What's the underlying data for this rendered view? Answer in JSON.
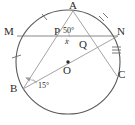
{
  "figure": {
    "type": "circle-geometry-diagram",
    "stroke_color": "#4a4a4a",
    "thin_stroke_color": "#9a9a9a",
    "text_color": "#2b2b2b",
    "background": "#ffffff",
    "circle": {
      "cx": 68,
      "cy": 62,
      "r": 52
    }
  },
  "points": {
    "A": {
      "label": "A",
      "x": 73,
      "y": 11,
      "lx": 69,
      "ly": 1
    },
    "M": {
      "label": "M",
      "x": 17,
      "y": 36,
      "lx": 6,
      "ly": 27
    },
    "N": {
      "label": "N",
      "x": 118,
      "y": 36,
      "lx": 118,
      "ly": 27
    },
    "B": {
      "label": "B",
      "x": 23,
      "y": 89,
      "lx": 12,
      "ly": 84
    },
    "C": {
      "label": "C",
      "x": 117,
      "y": 76,
      "lx": 119,
      "ly": 70
    },
    "P": {
      "label": "P",
      "x": 61,
      "y": 36,
      "lx": 55,
      "ly": 27
    },
    "Q": {
      "label": "Q",
      "x": 82,
      "y": 43,
      "lx": 79,
      "ly": 40
    },
    "O": {
      "label": "O",
      "x": 68,
      "y": 62,
      "lx": 64,
      "ly": 66
    }
  },
  "angles": {
    "at_P": {
      "value": "50",
      "unit": "°",
      "text": "50°",
      "lx": 64,
      "ly": 28
    },
    "x_angle": {
      "text": "x",
      "lx": 65,
      "ly": 37
    },
    "at_B": {
      "value": "15",
      "unit": "°",
      "text": "15°",
      "lx": 38,
      "ly": 83
    }
  },
  "arc_ticks": [
    {
      "arc": "MA",
      "count": 1
    },
    {
      "arc": "AN",
      "count": 2
    },
    {
      "arc": "NC",
      "count": 3
    },
    {
      "arc": "MB",
      "count": 1
    }
  ],
  "segments": [
    {
      "name": "chord-MN",
      "from": "M",
      "to": "N"
    },
    {
      "name": "chord-AB",
      "from": "A",
      "to": "B"
    },
    {
      "name": "chord-AC",
      "from": "A",
      "to": "C"
    },
    {
      "name": "line-BN",
      "from": "B",
      "to": "N"
    }
  ]
}
